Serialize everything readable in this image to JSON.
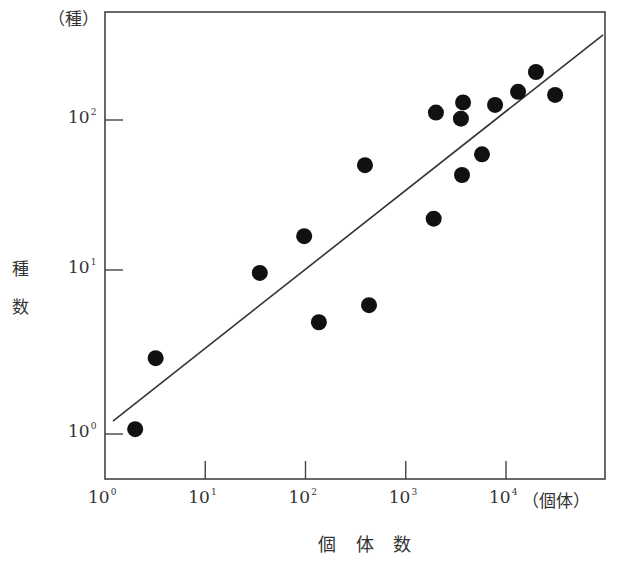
{
  "chart_data": {
    "type": "scatter",
    "title": "",
    "xlabel": "個 体 数",
    "xunit": "（個体）",
    "ylabel": "種数",
    "ylabel_chars": [
      "種",
      "数"
    ],
    "yunit": "（種）",
    "xscale": "log",
    "yscale": "log",
    "xlim": [
      1,
      100000
    ],
    "ylim": [
      0.5,
      450
    ],
    "grid": false,
    "legend": null,
    "x_ticks": [
      {
        "base": "10",
        "exp": "0",
        "value": 1
      },
      {
        "base": "10",
        "exp": "1",
        "value": 10
      },
      {
        "base": "10",
        "exp": "2",
        "value": 100
      },
      {
        "base": "10",
        "exp": "3",
        "value": 1000
      },
      {
        "base": "10",
        "exp": "4",
        "value": 10000
      }
    ],
    "y_ticks": [
      {
        "base": "10",
        "exp": "0",
        "value": 1
      },
      {
        "base": "10",
        "exp": "1",
        "value": 10
      },
      {
        "base": "10",
        "exp": "2",
        "value": 100
      }
    ],
    "points": [
      {
        "x": 2.0,
        "y": 1.07
      },
      {
        "x": 3.2,
        "y": 2.9
      },
      {
        "x": 35,
        "y": 9.6
      },
      {
        "x": 97,
        "y": 16.8
      },
      {
        "x": 136,
        "y": 4.8
      },
      {
        "x": 392,
        "y": 50
      },
      {
        "x": 430,
        "y": 6.1
      },
      {
        "x": 1900,
        "y": 22
      },
      {
        "x": 2000,
        "y": 112
      },
      {
        "x": 3550,
        "y": 102
      },
      {
        "x": 3640,
        "y": 43
      },
      {
        "x": 3730,
        "y": 131
      },
      {
        "x": 5760,
        "y": 59
      },
      {
        "x": 7780,
        "y": 126
      },
      {
        "x": 13200,
        "y": 154
      },
      {
        "x": 19900,
        "y": 209
      },
      {
        "x": 30900,
        "y": 147
      }
    ],
    "regression_line": {
      "x0": 1.2,
      "y0": 1.2,
      "x1": 93000,
      "y1": 370
    },
    "colors": {
      "points": "#111111",
      "line": "#333333",
      "axes": "#444444"
    }
  }
}
